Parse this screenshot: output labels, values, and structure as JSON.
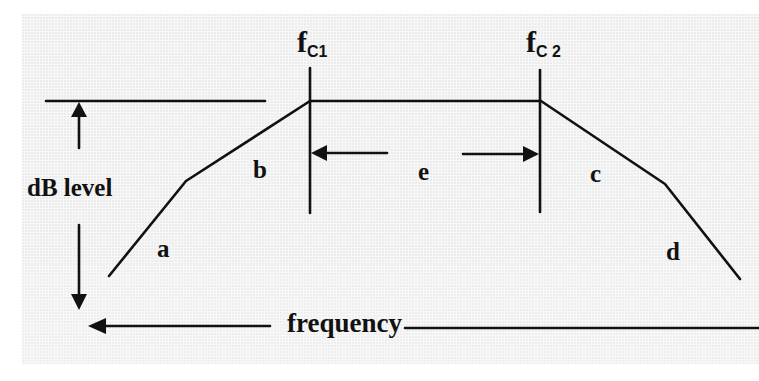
{
  "diagram": {
    "type": "frequency-response",
    "colors": {
      "ink": "#111111",
      "background": "#f7f7f7"
    },
    "labels": {
      "fc1_main": "f",
      "fc1_sub": "C1",
      "fc2_main": "f",
      "fc2_sub": "C 2",
      "db_level": "dB level",
      "frequency": "frequency",
      "a": "a",
      "b": "b",
      "c": "c",
      "d": "d",
      "e": "e"
    },
    "regions": [
      {
        "id": "a",
        "meaning": "low-frequency steep roll-off slope"
      },
      {
        "id": "b",
        "meaning": "low-frequency shallow roll-off slope"
      },
      {
        "id": "e",
        "meaning": "passband between fC1 and fC2"
      },
      {
        "id": "c",
        "meaning": "high-frequency shallow roll-off slope"
      },
      {
        "id": "d",
        "meaning": "high-frequency steep roll-off slope"
      }
    ],
    "axes": {
      "x": "frequency",
      "y": "dB level"
    }
  }
}
